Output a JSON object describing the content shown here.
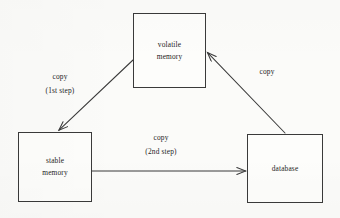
{
  "diagram": {
    "background_color": "#fbfbf9",
    "stroke_color": "#3a3a3a",
    "text_color": "#1d1d1d",
    "nodes": [
      {
        "id": "volatile-memory",
        "line1": "volatile",
        "line2": "memory",
        "x": 133,
        "y": 13,
        "width": 73,
        "height": 75
      },
      {
        "id": "stable-memory",
        "line1": "stable",
        "line2": "memory",
        "x": 18,
        "y": 132,
        "width": 74,
        "height": 70
      },
      {
        "id": "database",
        "line1": "database",
        "line2": "",
        "x": 247,
        "y": 134,
        "width": 76,
        "height": 69
      }
    ],
    "edges": [
      {
        "id": "volatile-to-stable",
        "from": "volatile-memory",
        "to": "stable-memory",
        "label_line1": "copy",
        "label_line2": "(1st step)",
        "x1": 133,
        "y1": 60,
        "x2": 58,
        "y2": 131
      },
      {
        "id": "stable-to-database",
        "from": "stable-memory",
        "to": "database",
        "label_line1": "copy",
        "label_line2": "(2nd step)",
        "x1": 92,
        "y1": 171,
        "x2": 246,
        "y2": 171
      },
      {
        "id": "database-to-volatile",
        "from": "database",
        "to": "volatile-memory",
        "label_line1": "copy",
        "label_line2": "",
        "x1": 285,
        "y1": 133,
        "x2": 207,
        "y2": 52
      }
    ],
    "labels": [
      {
        "id": "label-copy-1st-step",
        "line1": "copy",
        "line2": "(1st step)",
        "x": 36,
        "y": 73,
        "width": 48
      },
      {
        "id": "label-copy-2nd-step",
        "line1": "copy",
        "line2": "(2nd step)",
        "x": 133,
        "y": 134,
        "width": 56
      },
      {
        "id": "label-copy-right",
        "line1": "copy",
        "line2": "",
        "x": 254,
        "y": 68,
        "width": 26
      }
    ]
  }
}
